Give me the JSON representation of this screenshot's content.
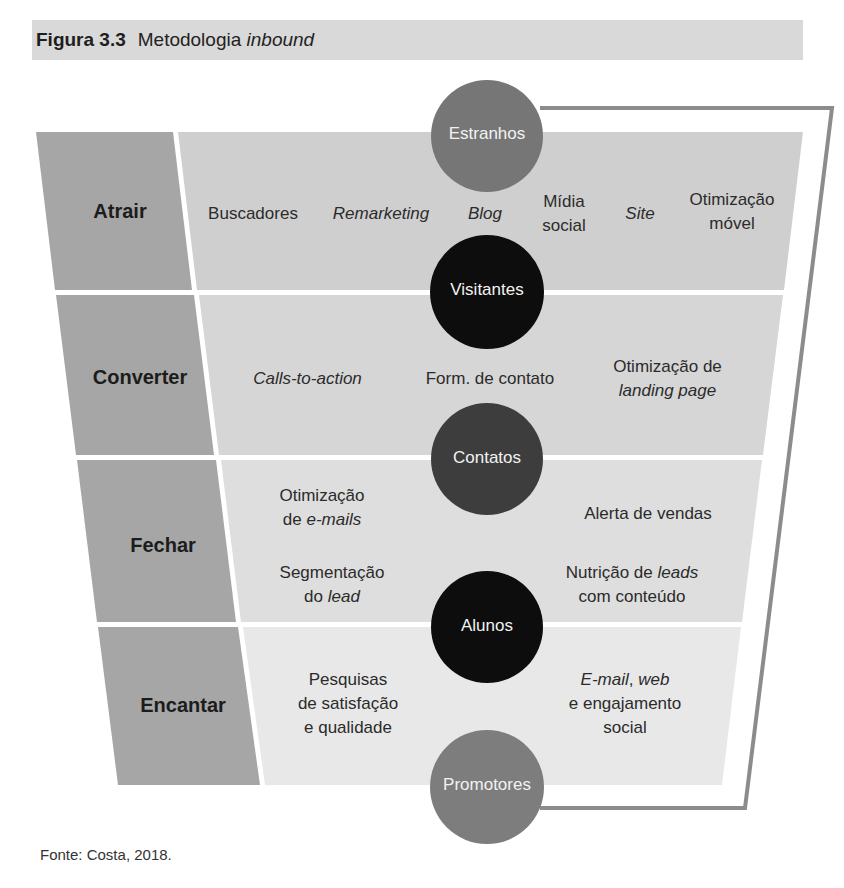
{
  "figure": {
    "number": "Figura 3.3",
    "title_prefix": "Metodologia ",
    "title_italic": "inbound"
  },
  "colors": {
    "title_bar": "#d9d9d9",
    "stage_column": "#a6a6a6",
    "band_atrair": "#cfcfcf",
    "band_converter": "#d6d6d6",
    "band_fechar": "#dedede",
    "band_encantar": "#e8e8e8",
    "outline": "#8c8c8c",
    "circle_light": "#767676",
    "circle_dark": "#0d0d0d",
    "circle_mid": "#3d3d3d"
  },
  "stages": [
    {
      "label": "Atrair"
    },
    {
      "label": "Converter"
    },
    {
      "label": "Fechar"
    },
    {
      "label": "Encantar"
    }
  ],
  "audiences": [
    {
      "label": "Estranhos"
    },
    {
      "label": "Visitantes"
    },
    {
      "label": "Contatos"
    },
    {
      "label": "Alunos"
    },
    {
      "label": "Promotores"
    }
  ],
  "tools": {
    "atrair": {
      "buscadores": "Buscadores",
      "remarketing": "Remarketing",
      "blog": "Blog",
      "midia_social_1": "Mídia",
      "midia_social_2": "social",
      "site": "Site",
      "otimizacao_movel_1": "Otimização",
      "otimizacao_movel_2": "móvel"
    },
    "converter": {
      "ctas": "Calls-to-action",
      "form": "Form. de contato",
      "landing_1": "Otimização de",
      "landing_2": "landing page"
    },
    "fechar": {
      "emails_1": "Otimização",
      "emails_2a": "de ",
      "emails_2b": "e-mails",
      "segment_1": "Segmentação",
      "segment_2a": "do ",
      "segment_2b": "lead",
      "alerta": "Alerta de vendas",
      "nutricao_1a": "Nutrição de ",
      "nutricao_1b": "leads",
      "nutricao_2": "com conteúdo"
    },
    "encantar": {
      "pesquisas_1": "Pesquisas",
      "pesquisas_2": "de satisfação",
      "pesquisas_3": "e qualidade",
      "email_web_a": "E-mail",
      "email_web_b": ", ",
      "email_web_c": "web",
      "engaj_1": "e engajamento",
      "engaj_2": "social"
    }
  },
  "source": "Fonte: Costa, 2018."
}
